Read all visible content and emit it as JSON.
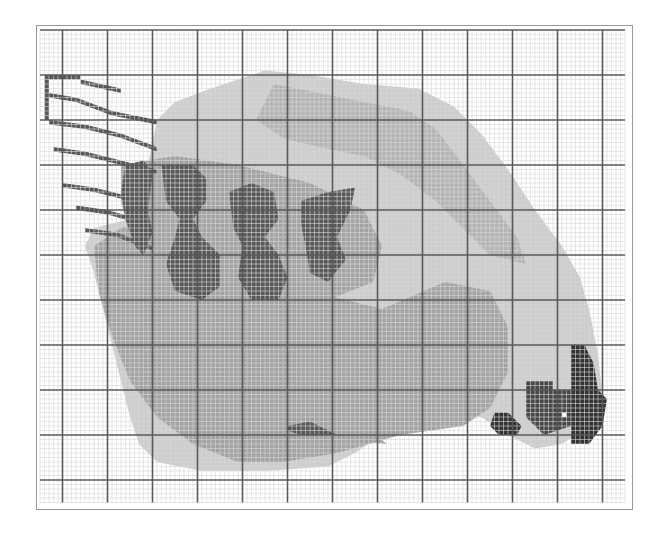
{
  "pattern": {
    "title": "Cross-stitch chart: pecking hen",
    "grid": {
      "origin_x": 40,
      "origin_y": 30,
      "cell": 4.5,
      "cols": 130,
      "rows": 105,
      "major_every": 10,
      "major_col_offset": 5,
      "major_row_offset": 0,
      "minor_color": "#d6d6d6",
      "major_color": "#5a5a5a"
    },
    "palette": {
      "light": "#cdcdcd",
      "medium": "#a3a3a3",
      "speckle": "#b4b4b4",
      "dark": "#585858",
      "darker": "#474747",
      "darkest": "#323232",
      "eye": "#ffffff"
    },
    "shapes": [
      {
        "name": "body-light",
        "color": "light",
        "pts": [
          [
            50,
            9
          ],
          [
            60,
            10
          ],
          [
            72,
            12
          ],
          [
            84,
            13
          ],
          [
            92,
            17
          ],
          [
            98,
            23
          ],
          [
            104,
            31
          ],
          [
            110,
            40
          ],
          [
            116,
            48
          ],
          [
            120,
            55
          ],
          [
            122,
            62
          ],
          [
            124,
            72
          ],
          [
            125,
            82
          ],
          [
            122,
            88
          ],
          [
            116,
            92
          ],
          [
            110,
            93
          ],
          [
            104,
            90
          ],
          [
            98,
            86
          ],
          [
            90,
            85
          ],
          [
            82,
            86
          ],
          [
            76,
            90
          ],
          [
            70,
            94
          ],
          [
            64,
            97
          ],
          [
            50,
            98
          ],
          [
            36,
            98
          ],
          [
            26,
            96
          ],
          [
            22,
            92
          ],
          [
            20,
            86
          ],
          [
            18,
            78
          ],
          [
            16,
            70
          ],
          [
            14,
            62
          ],
          [
            12,
            54
          ],
          [
            10,
            48
          ],
          [
            12,
            44
          ],
          [
            20,
            42
          ],
          [
            24,
            40
          ],
          [
            22,
            36
          ],
          [
            24,
            30
          ],
          [
            26,
            20
          ],
          [
            30,
            16
          ],
          [
            38,
            13
          ]
        ]
      },
      {
        "name": "body-lower-medium",
        "color": "medium",
        "pts": [
          [
            12,
            48
          ],
          [
            18,
            44
          ],
          [
            26,
            42
          ],
          [
            40,
            46
          ],
          [
            60,
            58
          ],
          [
            76,
            62
          ],
          [
            90,
            56
          ],
          [
            100,
            58
          ],
          [
            104,
            66
          ],
          [
            104,
            76
          ],
          [
            100,
            84
          ],
          [
            94,
            88
          ],
          [
            80,
            90
          ],
          [
            66,
            94
          ],
          [
            54,
            96
          ],
          [
            44,
            96
          ],
          [
            34,
            92
          ],
          [
            26,
            86
          ],
          [
            20,
            78
          ],
          [
            16,
            68
          ],
          [
            13,
            58
          ]
        ]
      },
      {
        "name": "wing-medium",
        "color": "medium",
        "pts": [
          [
            18,
            30
          ],
          [
            30,
            28
          ],
          [
            44,
            30
          ],
          [
            60,
            34
          ],
          [
            72,
            40
          ],
          [
            76,
            48
          ],
          [
            74,
            56
          ],
          [
            64,
            60
          ],
          [
            50,
            58
          ],
          [
            36,
            58
          ],
          [
            26,
            54
          ],
          [
            20,
            46
          ],
          [
            18,
            38
          ]
        ]
      },
      {
        "name": "feather-dark-1",
        "color": "dark",
        "pts": [
          [
            19,
            30
          ],
          [
            23,
            29
          ],
          [
            25,
            32
          ],
          [
            24,
            40
          ],
          [
            25,
            45
          ],
          [
            23,
            50
          ],
          [
            21,
            48
          ],
          [
            19,
            42
          ],
          [
            18,
            36
          ]
        ]
      },
      {
        "name": "feather-dark-2",
        "color": "dark",
        "pts": [
          [
            27,
            30
          ],
          [
            34,
            30
          ],
          [
            37,
            33
          ],
          [
            37,
            38
          ],
          [
            34,
            42
          ],
          [
            36,
            46
          ],
          [
            40,
            50
          ],
          [
            40,
            57
          ],
          [
            36,
            60
          ],
          [
            30,
            58
          ],
          [
            28,
            52
          ],
          [
            30,
            46
          ],
          [
            31,
            42
          ],
          [
            28,
            38
          ]
        ]
      },
      {
        "name": "feather-dark-3",
        "color": "dark",
        "pts": [
          [
            42,
            36
          ],
          [
            47,
            34
          ],
          [
            52,
            36
          ],
          [
            53,
            42
          ],
          [
            50,
            46
          ],
          [
            53,
            50
          ],
          [
            55,
            55
          ],
          [
            53,
            60
          ],
          [
            47,
            60
          ],
          [
            44,
            55
          ],
          [
            45,
            48
          ],
          [
            43,
            44
          ]
        ]
      },
      {
        "name": "feather-dark-4",
        "color": "dark",
        "pts": [
          [
            58,
            38
          ],
          [
            64,
            36
          ],
          [
            70,
            35
          ],
          [
            69,
            40
          ],
          [
            66,
            46
          ],
          [
            68,
            51
          ],
          [
            64,
            56
          ],
          [
            60,
            54
          ],
          [
            59,
            48
          ],
          [
            58,
            43
          ]
        ]
      },
      {
        "name": "speckle-back",
        "color": "speckle",
        "pts": [
          [
            52,
            12
          ],
          [
            62,
            14
          ],
          [
            72,
            16
          ],
          [
            82,
            18
          ],
          [
            88,
            22
          ],
          [
            94,
            30
          ],
          [
            100,
            38
          ],
          [
            106,
            46
          ],
          [
            108,
            52
          ],
          [
            100,
            50
          ],
          [
            94,
            44
          ],
          [
            88,
            38
          ],
          [
            80,
            32
          ],
          [
            72,
            28
          ],
          [
            62,
            26
          ],
          [
            54,
            24
          ],
          [
            48,
            20
          ]
        ]
      },
      {
        "name": "tail-1",
        "color": "dark",
        "pts": [
          [
            1,
            10
          ],
          [
            9,
            10
          ],
          [
            9,
            11
          ],
          [
            2,
            11
          ],
          [
            2,
            20
          ],
          [
            1,
            20
          ]
        ]
      },
      {
        "name": "tail-2",
        "color": "dark",
        "pts": [
          [
            9,
            11
          ],
          [
            18,
            13
          ],
          [
            18,
            14
          ],
          [
            9,
            12
          ]
        ]
      },
      {
        "name": "tail-3",
        "color": "dark",
        "pts": [
          [
            2,
            14
          ],
          [
            8,
            15
          ],
          [
            16,
            18
          ],
          [
            26,
            20
          ],
          [
            26,
            21
          ],
          [
            16,
            19
          ],
          [
            8,
            16
          ],
          [
            2,
            15
          ]
        ]
      },
      {
        "name": "tail-4",
        "color": "dark",
        "pts": [
          [
            2,
            20
          ],
          [
            10,
            21
          ],
          [
            18,
            23
          ],
          [
            26,
            26
          ],
          [
            26,
            27
          ],
          [
            18,
            24
          ],
          [
            10,
            22
          ],
          [
            2,
            21
          ]
        ]
      },
      {
        "name": "tail-5",
        "color": "dark",
        "pts": [
          [
            3,
            26
          ],
          [
            10,
            27
          ],
          [
            18,
            29
          ],
          [
            26,
            31
          ],
          [
            26,
            32
          ],
          [
            18,
            30
          ],
          [
            10,
            28
          ],
          [
            3,
            27
          ]
        ]
      },
      {
        "name": "tail-6",
        "color": "dark",
        "pts": [
          [
            5,
            34
          ],
          [
            12,
            35
          ],
          [
            20,
            37
          ],
          [
            20,
            38
          ],
          [
            12,
            36
          ],
          [
            5,
            35
          ]
        ]
      },
      {
        "name": "tail-7",
        "color": "dark",
        "pts": [
          [
            8,
            39
          ],
          [
            15,
            40
          ],
          [
            22,
            42
          ],
          [
            22,
            43
          ],
          [
            15,
            41
          ],
          [
            8,
            40
          ]
        ]
      },
      {
        "name": "tail-8",
        "color": "dark",
        "pts": [
          [
            10,
            44
          ],
          [
            17,
            45
          ],
          [
            25,
            48
          ],
          [
            25,
            49
          ],
          [
            17,
            46
          ],
          [
            10,
            45
          ]
        ]
      },
      {
        "name": "head-face",
        "color": "darker",
        "pts": [
          [
            108,
            78
          ],
          [
            114,
            78
          ],
          [
            114,
            80
          ],
          [
            118,
            80
          ],
          [
            118,
            88
          ],
          [
            112,
            90
          ],
          [
            108,
            86
          ]
        ]
      },
      {
        "name": "head-comb",
        "color": "darkest",
        "pts": [
          [
            118,
            70
          ],
          [
            121,
            70
          ],
          [
            123,
            74
          ],
          [
            124,
            80
          ],
          [
            126,
            82
          ],
          [
            125,
            88
          ],
          [
            122,
            92
          ],
          [
            118,
            92
          ],
          [
            118,
            80
          ]
        ]
      },
      {
        "name": "wattle",
        "color": "darkest",
        "pts": [
          [
            101,
            85
          ],
          [
            104,
            85
          ],
          [
            107,
            88
          ],
          [
            106,
            90
          ],
          [
            102,
            90
          ],
          [
            100,
            88
          ]
        ]
      },
      {
        "name": "foot-1",
        "color": "dark",
        "pts": [
          [
            55,
            88
          ],
          [
            60,
            87
          ],
          [
            64,
            89
          ],
          [
            66,
            90
          ],
          [
            58,
            90
          ],
          [
            55,
            89
          ]
        ]
      },
      {
        "name": "foot-2",
        "color": "medium",
        "pts": [
          [
            65,
            89
          ],
          [
            72,
            89
          ],
          [
            76,
            91
          ],
          [
            77,
            92
          ],
          [
            68,
            91
          ]
        ]
      }
    ],
    "eye": {
      "col": 116,
      "row": 85
    }
  }
}
